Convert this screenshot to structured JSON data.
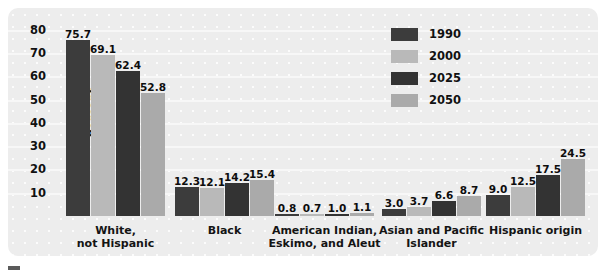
{
  "chart_data": {
    "type": "bar",
    "title": "",
    "xlabel": "",
    "ylabel": "Percent",
    "ylim": [
      0,
      85
    ],
    "yticks": [
      10,
      20,
      30,
      40,
      50,
      60,
      70,
      80
    ],
    "grid": true,
    "legend_position": "top-right",
    "categories": [
      "White,\nnot Hispanic",
      "Black",
      "American Indian,\nEskimo, and Aleut",
      "Asian and Pacific\nIslander",
      "Hispanic origin"
    ],
    "category_lines": [
      [
        "White,",
        "not Hispanic"
      ],
      [
        "Black",
        ""
      ],
      [
        "American Indian,",
        "Eskimo, and Aleut"
      ],
      [
        "Asian and Pacific",
        "Islander"
      ],
      [
        "Hispanic origin",
        ""
      ]
    ],
    "series": [
      {
        "name": "1990",
        "color": "#3c3c3c",
        "values": [
          75.7,
          12.3,
          0.8,
          3.0,
          9.0
        ]
      },
      {
        "name": "2000",
        "color": "#b9b9b9",
        "values": [
          69.1,
          12.1,
          0.7,
          3.7,
          12.5
        ]
      },
      {
        "name": "2025",
        "color": "#333333",
        "values": [
          62.4,
          14.2,
          1.0,
          6.6,
          17.5
        ]
      },
      {
        "name": "2050",
        "color": "#aaaaaa",
        "values": [
          52.8,
          15.4,
          1.1,
          8.7,
          24.5
        ]
      }
    ]
  },
  "legend": {
    "items": [
      {
        "label": "1990",
        "color": "#3c3c3c"
      },
      {
        "label": "2000",
        "color": "#b9b9b9"
      },
      {
        "label": "2025",
        "color": "#333333"
      },
      {
        "label": "2050",
        "color": "#aaaaaa"
      }
    ]
  }
}
